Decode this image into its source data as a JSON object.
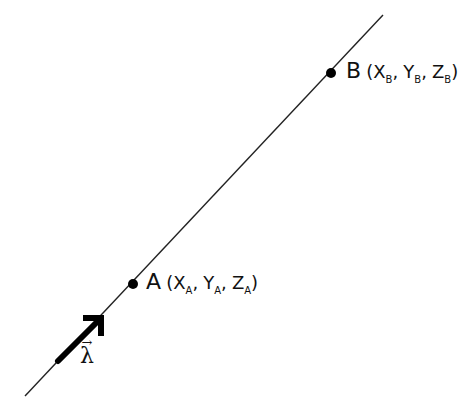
{
  "diagram": {
    "line": {
      "x1": 25,
      "y1": 396,
      "x2": 383,
      "y2": 15,
      "color": "#222222"
    },
    "points": [
      {
        "id": "A",
        "label": "A",
        "cx": 133,
        "cy": 284,
        "coords": [
          "X",
          "Y",
          "Z"
        ],
        "sub": "A",
        "text_open": "(",
        "sep": ",",
        "text_close": ")"
      },
      {
        "id": "B",
        "label": "B",
        "cx": 331,
        "cy": 73,
        "coords": [
          "X",
          "Y",
          "Z"
        ],
        "sub": "B",
        "text_open": "(",
        "sep": ",",
        "text_close": ")"
      }
    ],
    "vector": {
      "label": "λ",
      "arrow_over": "→",
      "x1": 58,
      "y1": 361,
      "x2": 101,
      "y2": 318
    }
  }
}
